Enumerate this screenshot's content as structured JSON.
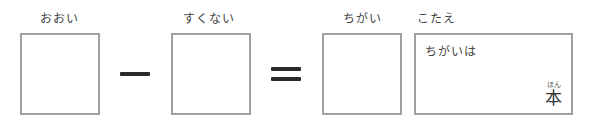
{
  "labels": {
    "more": "おおい",
    "less": "すくない",
    "difference": "ちがい",
    "answer": "こたえ"
  },
  "operators": {
    "minus": "−",
    "equals": "="
  },
  "answer_box": {
    "prefix": "ちがいは",
    "unit": "本",
    "unit_reading": "ほん"
  },
  "colors": {
    "box_border": "#a0a0a0",
    "operator": "#2a2a2a",
    "text": "#444444"
  }
}
